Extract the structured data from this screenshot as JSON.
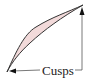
{
  "diagram": {
    "label": "Cusps",
    "region_fill": "#f2dada",
    "stroke_color": "#333333",
    "cusps": [
      "bottom-left",
      "top-right"
    ]
  }
}
